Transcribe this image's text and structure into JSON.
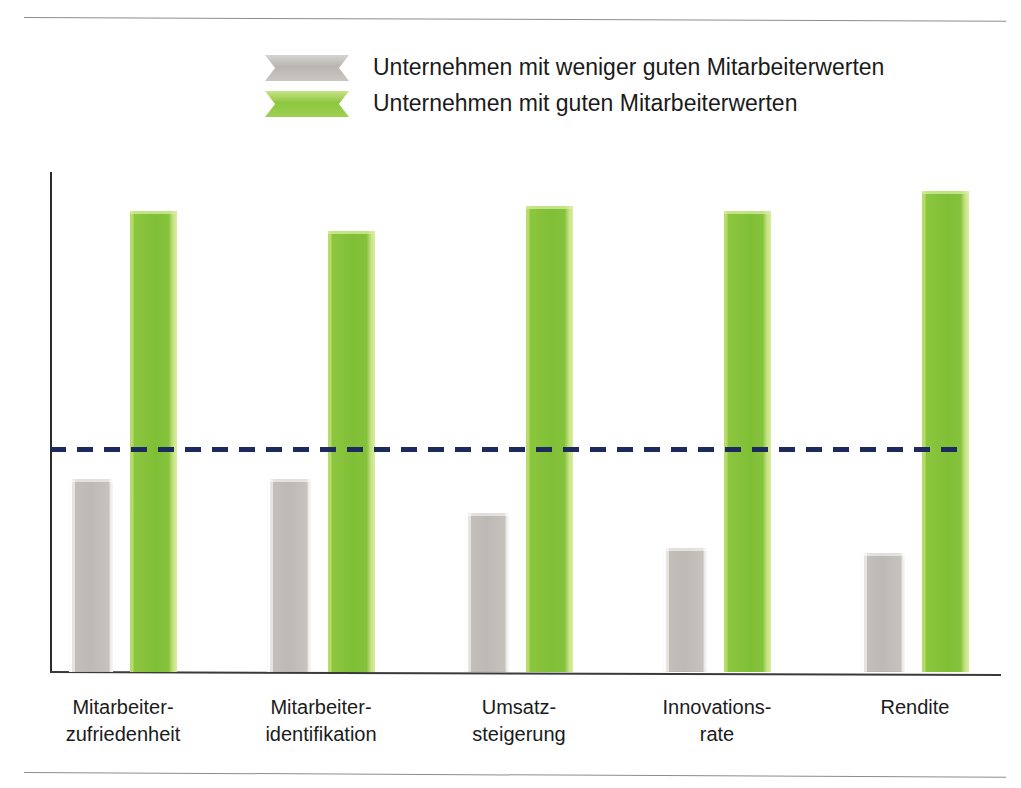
{
  "figure": {
    "has_top_rule": true,
    "has_bottom_rule": true,
    "background_color": "#ffffff"
  },
  "legend": {
    "position": "top-center",
    "items": [
      {
        "label": "Unternehmen mit weniger guten Mitarbeiterwerten",
        "color": "#b9b6b1",
        "series_key": "weniger_gut"
      },
      {
        "label": "Unternehmen mit guten Mitarbeiterwerten",
        "color": "#8cc63f",
        "series_key": "gut"
      }
    ]
  },
  "chart_data": {
    "type": "bar",
    "title": "",
    "subtitle": "",
    "xlabel": "",
    "ylabel": "",
    "ylim": [
      0,
      100
    ],
    "grid": false,
    "legend_position": "top-center",
    "categories": [
      "Mitarbeiter-\nzufriedenheit",
      "Mitarbeiter-\nidentifikation",
      "Umsatz-\nsteigerung",
      "Innovations-\nrate",
      "Rendite"
    ],
    "category_lines": [
      [
        "Mitarbeiter-",
        "zufriedenheit"
      ],
      [
        "Mitarbeiter-",
        "identifikation"
      ],
      [
        "Umsatz-",
        "steigerung"
      ],
      [
        "Innovations-",
        "rate"
      ],
      [
        "Rendite"
      ]
    ],
    "series": [
      {
        "name": "Unternehmen mit weniger guten Mitarbeiterwerten",
        "color": "#b9b6b1",
        "values": [
          39,
          39,
          32,
          25,
          24
        ]
      },
      {
        "name": "Unternehmen mit guten Mitarbeiterwerten",
        "color": "#8cc63f",
        "values": [
          93,
          89,
          94,
          93,
          97
        ]
      }
    ],
    "reference_line": {
      "label": "",
      "value": 45,
      "style": "dashed",
      "color": "#1d2a5e"
    },
    "axis": {
      "show_y_axis_line": true,
      "show_x_axis_line": true,
      "show_tick_labels": false,
      "y_tick_labels": [],
      "x_tick_labels": [
        "Mitarbeiter-zufriedenheit",
        "Mitarbeiter-identifikation",
        "Umsatz-steigerung",
        "Innovations-rate",
        "Rendite"
      ]
    }
  }
}
